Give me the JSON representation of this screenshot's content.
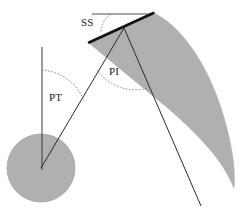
{
  "figure": {
    "background_color": "#ffffff",
    "shape_fill_color": "#b0b0b0",
    "shape_stroke_color": "#9a9a9a",
    "line_color": "#1a1a1a",
    "arc_color": "#6e6e6e",
    "thick_line_color": "#111111"
  },
  "annotations": {
    "ss": {
      "label": "SS",
      "meaning": "Sacral Slope",
      "x": 81,
      "y": 17
    },
    "pt": {
      "label": "PT",
      "meaning": "Pelvic Tilt",
      "x": 49,
      "y": 92
    },
    "pi": {
      "label": "PI",
      "meaning": "Pelvic Incidence",
      "x": 109,
      "y": 66
    }
  },
  "elements": {
    "femoral_head": {
      "name": "femoral-head-circle",
      "cx": 41,
      "cy": 168,
      "r": 34,
      "fill": "#b0b0b0"
    },
    "sacral_endplate": {
      "name": "sacral-endplate-line",
      "x1": 89,
      "y1": 42,
      "x2": 153,
      "y2": 13
    },
    "horizontal_reference": {
      "name": "horizontal-reference-line",
      "x1": 92,
      "y1": 14,
      "x2": 153,
      "y2": 14
    },
    "vertical_reference": {
      "name": "vertical-reference-line",
      "x1": 42,
      "y1": 47,
      "x2": 42,
      "y2": 170
    },
    "pelvic_tilt_line": {
      "name": "pelvic-tilt-line",
      "x1": 41,
      "y1": 168,
      "x2": 124,
      "y2": 28
    },
    "pelvic_incidence_line": {
      "name": "pelvic-incidence-perpendicular-line",
      "x1": 124,
      "y1": 28,
      "x2": 201,
      "y2": 206
    },
    "spine_band": {
      "name": "lumbar-spine-band",
      "fill": "#b0b0b0"
    }
  }
}
